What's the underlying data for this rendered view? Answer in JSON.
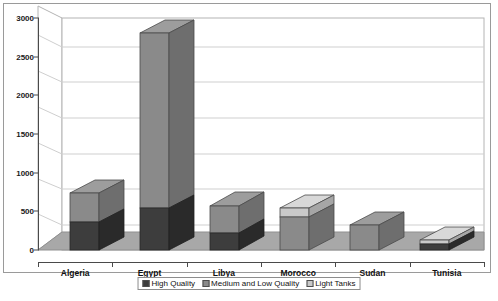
{
  "chart_data": {
    "type": "bar",
    "subtype": "stacked-column-3d",
    "title": "",
    "xlabel": "",
    "ylabel": "",
    "ylim": [
      0,
      3000
    ],
    "ytick_step": 500,
    "grid": true,
    "legend_position": "bottom",
    "categories": [
      "Algeria",
      "Egypt",
      "Libya",
      "Morocco",
      "Sudan",
      "Tunisia"
    ],
    "ytick_labels": [
      "0",
      "500",
      "1000",
      "1500",
      "2000",
      "2500",
      "3000"
    ],
    "ytick_values": [
      0,
      500,
      1000,
      1500,
      2000,
      2500,
      3000
    ],
    "series": [
      {
        "name": "High Quality",
        "color": "#3d3d3d",
        "values": [
          390,
          585,
          240,
          0,
          0,
          84
        ]
      },
      {
        "name": "Medium and Low Quality",
        "color": "#8a8a8a",
        "values": [
          590,
          2475,
          550,
          645,
          530,
          0
        ]
      },
      {
        "name": "Light Tanks",
        "color": "#c9c9c9",
        "values": [
          0,
          0,
          0,
          120,
          0,
          146
        ]
      }
    ],
    "totals": [
      980,
      3060,
      790,
      765,
      530,
      230
    ],
    "colors": {
      "high_quality": "#3d3d3d",
      "medium_low_quality": "#8a8a8a",
      "light_tanks": "#c9c9c9",
      "floor": "#a8a8a8",
      "wall": "#ffffff",
      "gridline": "#cfcfcf",
      "axis": "#4a4a4a",
      "frame": "#9a9a9a"
    }
  },
  "legend": {
    "items": [
      {
        "label": "High Quality",
        "swatch": "#3d3d3d"
      },
      {
        "label": "Medium and Low Quality",
        "swatch": "#8a8a8a"
      },
      {
        "label": "Light Tanks",
        "swatch": "#c9c9c9"
      }
    ]
  }
}
